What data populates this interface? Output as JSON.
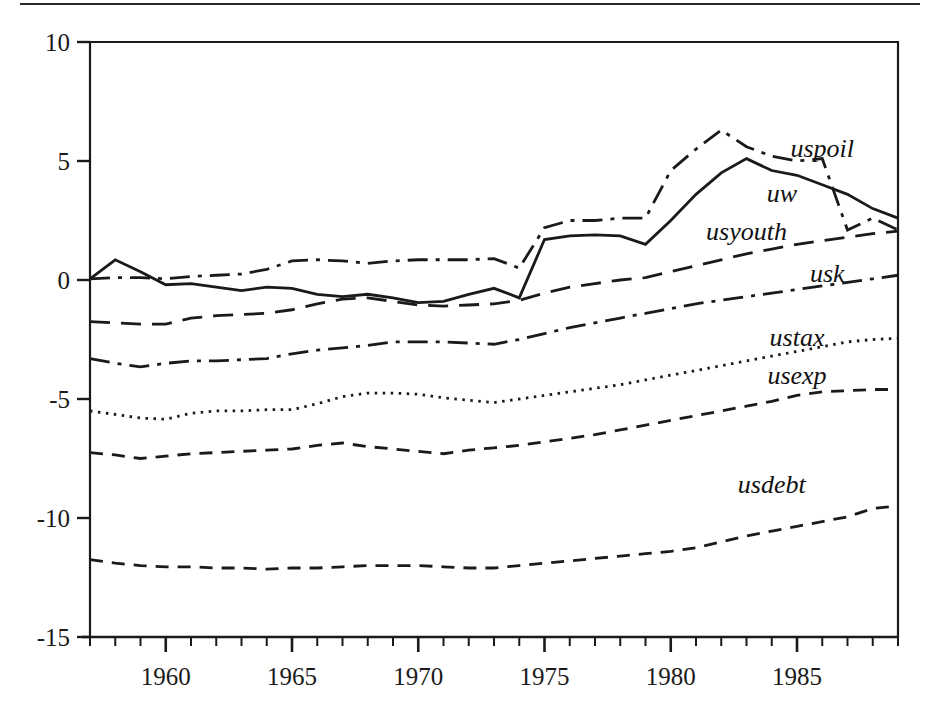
{
  "figure": {
    "background_color": "#ffffff",
    "ink_color": "#1a1a1a",
    "top_rule": true
  },
  "chart_data": {
    "type": "line",
    "title": "",
    "subtitle": "",
    "xlabel": "",
    "ylabel": "",
    "xlim": [
      1957,
      1989
    ],
    "ylim": [
      -15,
      10
    ],
    "grid": false,
    "legend_position": "inline-right",
    "y_ticks": [
      10,
      5,
      0,
      -5,
      -10,
      -15
    ],
    "y_tick_labels": [
      "10",
      "5",
      "0",
      "-5",
      "-10",
      "-15"
    ],
    "x_ticks": [
      1960,
      1965,
      1970,
      1975,
      1980,
      1985
    ],
    "x_tick_labels": [
      "1960",
      "1965",
      "1970",
      "1975",
      "1980",
      "1985"
    ],
    "x_minor_tick_interval": 1,
    "x": [
      1957,
      1958,
      1959,
      1960,
      1961,
      1962,
      1963,
      1964,
      1965,
      1966,
      1967,
      1968,
      1969,
      1970,
      1971,
      1972,
      1973,
      1974,
      1975,
      1976,
      1977,
      1978,
      1979,
      1980,
      1981,
      1982,
      1983,
      1984,
      1985,
      1986,
      1987,
      1988,
      1989
    ],
    "series": [
      {
        "name": "uw",
        "label": "uw",
        "linestyle": "solid",
        "label_position": {
          "x": 1984.4,
          "y": 3.6
        },
        "values": [
          0.05,
          0.85,
          0.35,
          -0.2,
          -0.15,
          -0.3,
          -0.45,
          -0.3,
          -0.35,
          -0.6,
          -0.7,
          -0.6,
          -0.75,
          -0.95,
          -0.9,
          -0.6,
          -0.35,
          -0.75,
          1.7,
          1.85,
          1.9,
          1.85,
          1.5,
          2.5,
          3.6,
          4.5,
          5.1,
          4.6,
          4.4,
          4.0,
          3.6,
          3.0,
          2.6
        ]
      },
      {
        "name": "uspoil",
        "label": "uspoil",
        "linestyle": "dashdot",
        "label_position": {
          "x": 1986.0,
          "y": 5.5
        },
        "values": [
          0.05,
          0.1,
          0.1,
          0.05,
          0.15,
          0.2,
          0.25,
          0.45,
          0.8,
          0.85,
          0.8,
          0.7,
          0.8,
          0.85,
          0.85,
          0.85,
          0.9,
          0.5,
          2.2,
          2.5,
          2.5,
          2.6,
          2.6,
          4.6,
          5.5,
          6.3,
          5.6,
          5.2,
          5.0,
          5.1,
          2.1,
          2.6,
          2.1
        ]
      },
      {
        "name": "usyouth",
        "label": "usyouth",
        "linestyle": "dashed-long",
        "label_position": {
          "x": 1983.0,
          "y": 2.0
        },
        "values": [
          -1.75,
          -1.8,
          -1.85,
          -1.85,
          -1.6,
          -1.5,
          -1.45,
          -1.4,
          -1.25,
          -1.0,
          -0.8,
          -0.75,
          -0.9,
          -1.05,
          -1.1,
          -1.05,
          -1.0,
          -0.85,
          -0.55,
          -0.3,
          -0.15,
          0.0,
          0.1,
          0.35,
          0.6,
          0.85,
          1.1,
          1.3,
          1.5,
          1.65,
          1.8,
          1.95,
          2.05
        ]
      },
      {
        "name": "usk",
        "label": "usk",
        "linestyle": "dashdot",
        "label_position": {
          "x": 1986.2,
          "y": 0.25
        },
        "values": [
          -3.3,
          -3.5,
          -3.65,
          -3.5,
          -3.4,
          -3.4,
          -3.35,
          -3.3,
          -3.1,
          -2.95,
          -2.85,
          -2.75,
          -2.6,
          -2.6,
          -2.6,
          -2.65,
          -2.7,
          -2.5,
          -2.25,
          -2.0,
          -1.8,
          -1.6,
          -1.4,
          -1.2,
          -1.0,
          -0.85,
          -0.7,
          -0.55,
          -0.4,
          -0.25,
          -0.1,
          0.05,
          0.2
        ]
      },
      {
        "name": "ustax",
        "label": "ustax",
        "linestyle": "dotted",
        "label_position": {
          "x": 1985.0,
          "y": -2.45
        },
        "values": [
          -5.5,
          -5.65,
          -5.8,
          -5.85,
          -5.6,
          -5.5,
          -5.5,
          -5.45,
          -5.45,
          -5.2,
          -4.9,
          -4.75,
          -4.75,
          -4.8,
          -4.95,
          -5.05,
          -5.15,
          -5.0,
          -4.85,
          -4.7,
          -4.55,
          -4.4,
          -4.2,
          -4.0,
          -3.8,
          -3.6,
          -3.4,
          -3.2,
          -3.0,
          -2.8,
          -2.6,
          -2.5,
          -2.45
        ]
      },
      {
        "name": "usexp",
        "label": "usexp",
        "linestyle": "dashed-medium",
        "label_position": {
          "x": 1985.0,
          "y": -4.05
        },
        "values": [
          -7.25,
          -7.35,
          -7.5,
          -7.4,
          -7.3,
          -7.25,
          -7.2,
          -7.15,
          -7.1,
          -6.95,
          -6.85,
          -7.0,
          -7.1,
          -7.2,
          -7.3,
          -7.15,
          -7.05,
          -6.95,
          -6.8,
          -6.65,
          -6.5,
          -6.3,
          -6.1,
          -5.9,
          -5.7,
          -5.5,
          -5.3,
          -5.1,
          -4.85,
          -4.7,
          -4.65,
          -4.6,
          -4.6
        ]
      },
      {
        "name": "usdebt",
        "label": "usdebt",
        "linestyle": "dashed-medium",
        "label_position": {
          "x": 1984.0,
          "y": -8.6
        },
        "values": [
          -11.75,
          -11.9,
          -12.0,
          -12.05,
          -12.05,
          -12.1,
          -12.1,
          -12.15,
          -12.1,
          -12.1,
          -12.05,
          -12.0,
          -12.0,
          -12.0,
          -12.05,
          -12.1,
          -12.1,
          -12.0,
          -11.9,
          -11.8,
          -11.7,
          -11.6,
          -11.5,
          -11.4,
          -11.25,
          -11.0,
          -10.75,
          -10.55,
          -10.35,
          -10.15,
          -9.95,
          -9.6,
          -9.5
        ]
      }
    ]
  }
}
